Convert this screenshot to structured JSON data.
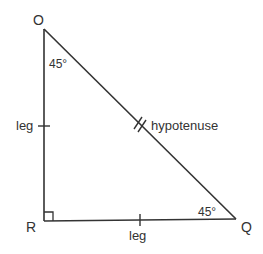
{
  "diagram": {
    "type": "right isosceles triangle (45-45-90)",
    "stroke_color": "#333333",
    "vertices": {
      "O": {
        "label": "O",
        "x": 44,
        "y": 29
      },
      "R": {
        "label": "R",
        "x": 44,
        "y": 221
      },
      "Q": {
        "label": "Q",
        "x": 236,
        "y": 219
      }
    },
    "angles": {
      "O": {
        "label": "45°"
      },
      "Q": {
        "label": "45°"
      },
      "R": {
        "label": "right angle"
      }
    },
    "sides": {
      "OR": {
        "label": "leg",
        "tick_marks": 1
      },
      "RQ": {
        "label": "leg",
        "tick_marks": 1
      },
      "OQ": {
        "label": "hypotenuse",
        "tick_marks": 2
      }
    }
  }
}
